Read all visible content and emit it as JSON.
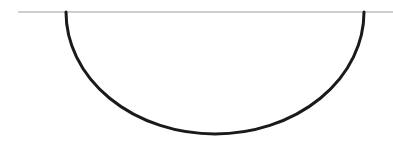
{
  "diagram": {
    "canvas": {
      "width": 393,
      "height": 152,
      "background": "#ffffff"
    },
    "baseline": {
      "x1": 18,
      "y1": 12,
      "x2": 393,
      "y2": 12,
      "color": "#9e9e9e",
      "stroke_width": 1.2
    },
    "arc": {
      "start": {
        "x": 66,
        "y": 12
      },
      "end": {
        "x": 364,
        "y": 12
      },
      "bottom": {
        "x": 215,
        "y": 134
      },
      "rx": 149,
      "ry": 122,
      "color": "#1a1a1a",
      "stroke_width": 3
    }
  }
}
